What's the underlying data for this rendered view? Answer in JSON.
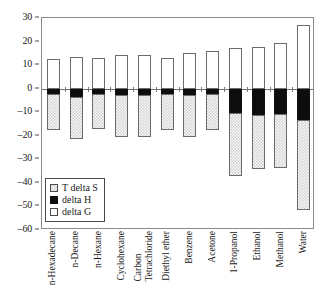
{
  "chart_data": {
    "type": "bar",
    "title": "",
    "xlabel": "",
    "ylabel": "",
    "ylim": [
      -60,
      30
    ],
    "ytick_step": 10,
    "yticks": [
      30,
      20,
      10,
      0,
      -10,
      -20,
      -30,
      -40,
      -50,
      -60
    ],
    "grid": false,
    "stacked": false,
    "legend_position": "inside-lower-left",
    "categories": [
      "n-Hexadecane",
      "n-Decane",
      "n-Hexane",
      "Cyclohexane",
      "Carbon Tetrachloride",
      "Diethyl ether",
      "Benzene",
      "Acetone",
      "1-Propanol",
      "Ethanol",
      "Methanol",
      "Water"
    ],
    "category_lines": [
      [
        "n-Hexadecane"
      ],
      [
        "n-Decane"
      ],
      [
        "n-Hexane"
      ],
      [
        "Cyclohexane"
      ],
      [
        "Carbon",
        "Tetrachloride"
      ],
      [
        "Diethyl ether"
      ],
      [
        "Benzene"
      ],
      [
        "Acetone"
      ],
      [
        "1-Propanol"
      ],
      [
        "Ethanol"
      ],
      [
        "Methanol"
      ],
      [
        "Water"
      ]
    ],
    "series": [
      {
        "name": "delta G",
        "key": "delta_g",
        "style": "open-white",
        "values": [
          12.8,
          13.3,
          13.2,
          14.3,
          14.3,
          12.9,
          15.3,
          16.0,
          17.2,
          17.5,
          19.4,
          26.9
        ]
      },
      {
        "name": "delta H",
        "key": "delta_h",
        "style": "solid-black",
        "values": [
          -2.4,
          -3.6,
          -2.1,
          -2.9,
          -2.6,
          -2.2,
          -2.8,
          -2.4,
          -10.2,
          -11.0,
          -10.6,
          -13.1
        ]
      },
      {
        "name": "T delta S",
        "key": "t_delta_s",
        "style": "stippled-gray",
        "values": [
          -17.4,
          -21.5,
          -17.2,
          -20.6,
          -20.4,
          -17.5,
          -20.7,
          -17.6,
          -37.0,
          -34.3,
          -33.8,
          -51.5
        ]
      }
    ]
  },
  "legend": {
    "items": [
      {
        "label": "T delta S",
        "swatch": "stippled-gray"
      },
      {
        "label": "delta H",
        "swatch": "solid-black"
      },
      {
        "label": "delta G",
        "swatch": "open-white"
      }
    ]
  },
  "colors": {
    "frame": "#8a8a8a",
    "axis": "#4a4a4a",
    "bar_outline": "#6b6b6b",
    "delta_h_fill": "#0d0d0d",
    "t_delta_s_fill": "#d6d6d6",
    "delta_g_fill": "#ffffff",
    "background": "#ffffff",
    "text": "#1a1a1a"
  }
}
